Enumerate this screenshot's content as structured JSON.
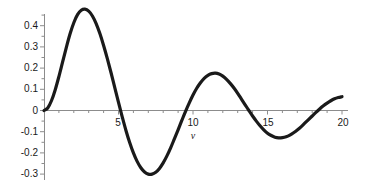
{
  "chart_data": {
    "type": "line",
    "title": "",
    "subtitle": "",
    "xlabel": "v",
    "ylabel": "",
    "xlim": [
      0,
      20
    ],
    "ylim": [
      -0.32,
      0.5
    ],
    "grid": false,
    "legend": null,
    "line_color": "#1a1a1a",
    "axis_color": "#8c8c8c",
    "background_color": "#ffffff",
    "x_ticks_major": [
      5,
      10,
      15,
      20
    ],
    "x_tick_labels": [
      "5",
      "10",
      "15",
      "20"
    ],
    "x_ticks_minor": [
      1,
      2,
      3,
      4,
      6,
      7,
      8,
      9,
      11,
      12,
      13,
      14,
      16,
      17,
      18,
      19
    ],
    "y_ticks": [
      0.4,
      0.3,
      0.2,
      0.1,
      0,
      -0.1,
      -0.2,
      -0.3
    ],
    "y_tick_labels": [
      "0.4",
      "0.3",
      "0.2",
      "0.1",
      "0",
      "-0.1",
      "-0.2",
      "-0.3"
    ],
    "series": [
      {
        "name": "damped-oscillation",
        "x": [
          0.0,
          0.25,
          0.5,
          0.75,
          1.0,
          1.25,
          1.5,
          1.75,
          2.0,
          2.25,
          2.5,
          2.75,
          3.0,
          3.25,
          3.5,
          3.75,
          4.0,
          4.25,
          4.5,
          4.75,
          5.0,
          5.25,
          5.5,
          5.75,
          6.0,
          6.25,
          6.5,
          6.75,
          7.0,
          7.25,
          7.5,
          7.75,
          8.0,
          8.25,
          8.5,
          8.75,
          9.0,
          9.25,
          9.5,
          9.75,
          10.0,
          10.25,
          10.5,
          10.75,
          11.0,
          11.25,
          11.5,
          11.75,
          12.0,
          12.25,
          12.5,
          12.75,
          13.0,
          13.25,
          13.5,
          13.75,
          14.0,
          14.25,
          14.5,
          14.75,
          15.0,
          15.25,
          15.5,
          15.75,
          16.0,
          16.25,
          16.5,
          16.75,
          17.0,
          17.25,
          17.5,
          17.75,
          18.0,
          18.25,
          18.5,
          18.75,
          19.0,
          19.25,
          19.5,
          19.75,
          20.0
        ],
        "y": [
          0.0,
          0.012,
          0.046,
          0.097,
          0.16,
          0.229,
          0.298,
          0.362,
          0.414,
          0.452,
          0.473,
          0.478,
          0.469,
          0.446,
          0.41,
          0.363,
          0.307,
          0.245,
          0.178,
          0.108,
          0.038,
          -0.03,
          -0.094,
          -0.151,
          -0.2,
          -0.24,
          -0.27,
          -0.29,
          -0.3,
          -0.3,
          -0.291,
          -0.273,
          -0.247,
          -0.214,
          -0.176,
          -0.134,
          -0.091,
          -0.047,
          -0.004,
          0.036,
          0.073,
          0.105,
          0.131,
          0.152,
          0.166,
          0.174,
          0.176,
          0.172,
          0.162,
          0.147,
          0.128,
          0.106,
          0.081,
          0.054,
          0.027,
          0.0,
          -0.026,
          -0.05,
          -0.072,
          -0.091,
          -0.107,
          -0.118,
          -0.126,
          -0.129,
          -0.128,
          -0.124,
          -0.116,
          -0.105,
          -0.092,
          -0.077,
          -0.06,
          -0.043,
          -0.026,
          -0.009,
          0.007,
          0.022,
          0.035,
          0.046,
          0.055,
          0.061,
          0.065
        ]
      }
    ],
    "key_points": {
      "start": {
        "v": 0.0,
        "value": 0.0
      },
      "peak_1": {
        "v": 2.9,
        "value": 0.48
      },
      "zero_1": {
        "v": 5.15,
        "value": 0.0
      },
      "trough_1": {
        "v": 7.0,
        "value": -0.305
      },
      "zero_2": {
        "v": 8.6,
        "value": 0.0
      },
      "peak_2": {
        "v": 10.3,
        "value": 0.255
      },
      "zero_3": {
        "v": 11.8,
        "value": 0.0
      },
      "trough_2": {
        "v": 13.4,
        "value": -0.215
      },
      "zero_4": {
        "v": 14.9,
        "value": 0.0
      },
      "peak_3": {
        "v": 16.6,
        "value": 0.2
      },
      "zero_5": {
        "v": 18.1,
        "value": 0.0
      },
      "end": {
        "v": 20.0,
        "value": -0.16
      }
    }
  }
}
